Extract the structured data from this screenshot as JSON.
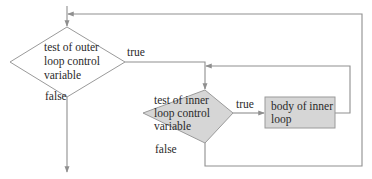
{
  "diagram": {
    "type": "flowchart",
    "colors": {
      "line": "#8f8f8f",
      "shaded_fill": "#d6d6d6",
      "plain_fill": "#ffffff",
      "text": "#2a2a2a"
    },
    "nodes": {
      "outer_test": {
        "shape": "diamond",
        "lines": [
          "test of outer",
          "loop control",
          "variable"
        ],
        "shaded": false
      },
      "inner_test": {
        "shape": "diamond",
        "lines": [
          "test of inner",
          "loop control",
          "variable"
        ],
        "shaded": true
      },
      "inner_body": {
        "shape": "rectangle",
        "lines": [
          "body of inner",
          "loop"
        ],
        "shaded": true
      }
    },
    "edges": {
      "outer_true": {
        "label": "true",
        "from": "outer_test",
        "to": "inner_test"
      },
      "outer_false": {
        "label": "false",
        "from": "outer_test",
        "to": "exit"
      },
      "inner_true": {
        "label": "true",
        "from": "inner_test",
        "to": "inner_body"
      },
      "inner_false": {
        "label": "false",
        "from": "inner_test",
        "to": "outer_test"
      },
      "body_loopback": {
        "label": "",
        "from": "inner_body",
        "to": "inner_test"
      }
    }
  }
}
